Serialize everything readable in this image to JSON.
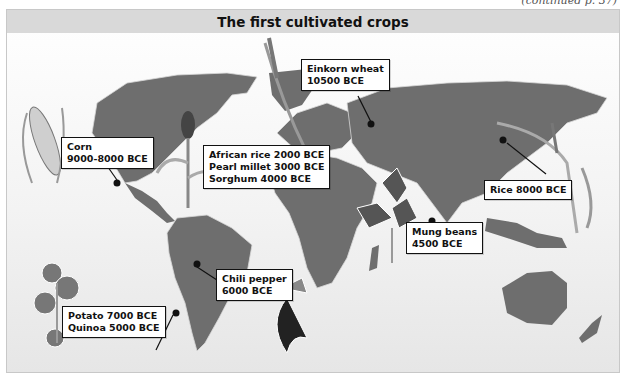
{
  "continued_note": "(continued p. 37)",
  "title": "The first cultivated crops",
  "colors": {
    "land": "#6e6e6e",
    "borders": "#d8d8d8",
    "ocean": "#f2f2f2",
    "title_bar": "#d9d9d9",
    "marker": "#111111"
  },
  "crops": [
    {
      "id": "corn",
      "lines": [
        "Corn",
        "9000-8000 BCE"
      ],
      "region": "Mexico"
    },
    {
      "id": "africa",
      "lines": [
        "African rice 2000 BCE",
        "Pearl millet 3000 BCE",
        "Sorghum 4000 BCE"
      ],
      "region": "West Africa"
    },
    {
      "id": "wheat",
      "lines": [
        "Einkorn wheat",
        "10500 BCE"
      ],
      "region": "Fertile Crescent"
    },
    {
      "id": "rice",
      "lines": [
        "Rice 8000 BCE"
      ],
      "region": "China"
    },
    {
      "id": "mung",
      "lines": [
        "Mung beans",
        "4500 BCE"
      ],
      "region": "India"
    },
    {
      "id": "chili",
      "lines": [
        "Chili pepper",
        "6000 BCE"
      ],
      "region": "South America"
    },
    {
      "id": "potato",
      "lines": [
        "Potato 7000 BCE",
        "Quinoa 5000 BCE"
      ],
      "region": "Andes"
    }
  ],
  "illustrations": [
    "corn-cob",
    "sorghum-plant",
    "wheat-stalk",
    "rice-stalk",
    "mung-bean-plant",
    "chili-pepper-plant",
    "potato-plant"
  ]
}
